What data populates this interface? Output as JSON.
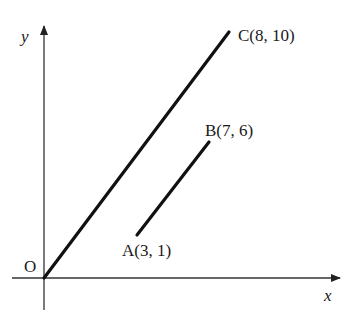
{
  "diagram": {
    "type": "coordinate-plane",
    "axes": {
      "x_label": "x",
      "y_label": "y",
      "origin_label": "O"
    },
    "points": [
      {
        "name": "A",
        "label": "A(3, 1)",
        "x": 3,
        "y": 1
      },
      {
        "name": "B",
        "label": "B(7, 6)",
        "x": 7,
        "y": 6
      },
      {
        "name": "C",
        "label": "C(8, 10)",
        "x": 8,
        "y": 10
      }
    ],
    "segments": [
      {
        "from": "O",
        "to": "C"
      },
      {
        "from": "A",
        "to": "B"
      }
    ],
    "colors": {
      "line": "#111111",
      "axis": "#333333",
      "background": "#ffffff"
    }
  }
}
